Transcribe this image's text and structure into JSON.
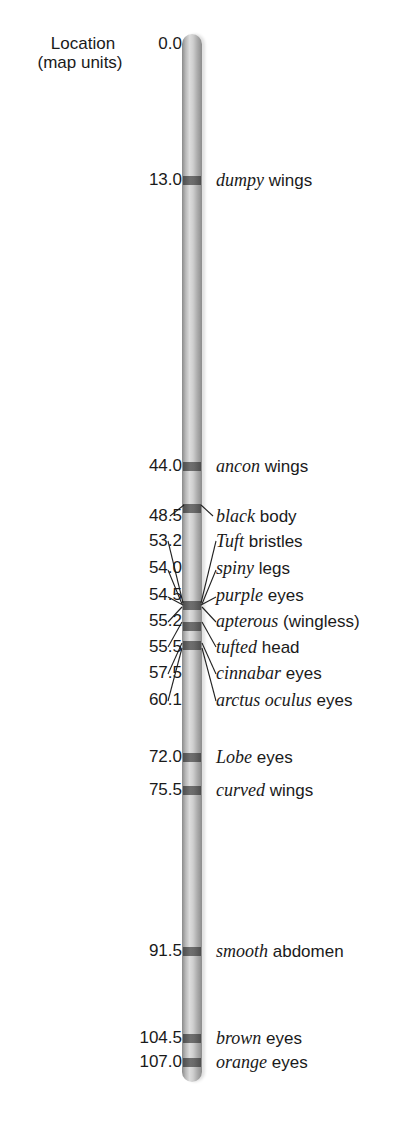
{
  "axis": {
    "title_line1": "Location",
    "title_line2": "(map units)",
    "start": "0.0"
  },
  "chromosome": {
    "length_map_units": 107.0,
    "body_color": "#c4c4c4",
    "band_color": "#5a5a5a"
  },
  "loci": [
    {
      "location": "13.0",
      "gene": "dumpy",
      "trait": "wings"
    },
    {
      "location": "44.0",
      "gene": "ancon",
      "trait": "wings"
    },
    {
      "location": "48.5",
      "gene": "black",
      "trait": "body"
    },
    {
      "location": "53.2",
      "gene": "Tuft",
      "trait": "bristles"
    },
    {
      "location": "54.0",
      "gene": "spiny",
      "trait": "legs"
    },
    {
      "location": "54.5",
      "gene": "purple",
      "trait": "eyes"
    },
    {
      "location": "55.2",
      "gene": "apterous",
      "trait": "(wingless)"
    },
    {
      "location": "55.5",
      "gene": "tufted",
      "trait": "head"
    },
    {
      "location": "57.5",
      "gene": "cinnabar",
      "trait": "eyes"
    },
    {
      "location": "60.1",
      "gene": "arctus oculus",
      "trait": "eyes"
    },
    {
      "location": "72.0",
      "gene": "Lobe",
      "trait": "eyes"
    },
    {
      "location": "75.5",
      "gene": "curved",
      "trait": "wings"
    },
    {
      "location": "91.5",
      "gene": "smooth",
      "trait": "abdomen"
    },
    {
      "location": "104.5",
      "gene": "brown",
      "trait": "eyes"
    },
    {
      "location": "107.0",
      "gene": "orange",
      "trait": "eyes"
    }
  ]
}
